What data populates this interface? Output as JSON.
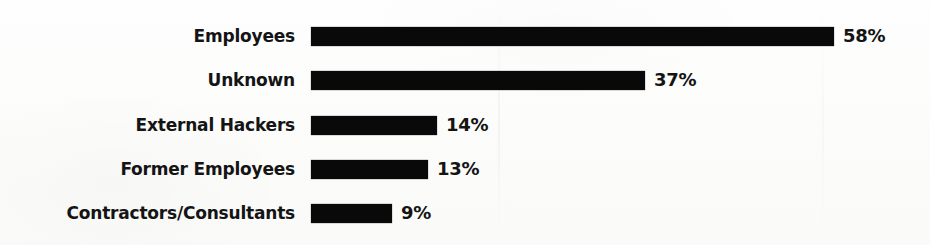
{
  "chart_data": {
    "type": "bar",
    "orientation": "horizontal",
    "title": "",
    "subtitle": "",
    "xlabel": "",
    "ylabel": "",
    "grid": false,
    "legend": false,
    "legend_position": "none",
    "value_suffix": "%",
    "xlim": [
      0,
      58
    ],
    "axis_ticks": [],
    "categories": [
      "Employees",
      "Unknown",
      "External Hackers",
      "Former Employees",
      "Contractors/Consultants"
    ],
    "values": [
      58,
      37,
      14,
      13,
      9
    ],
    "value_labels": [
      "58%",
      "37%",
      "14%",
      "13%",
      "9%"
    ],
    "bar_color": "#090909",
    "background_color": "#fdfdfc",
    "text_color": "#141414"
  },
  "layout": {
    "bar_origin_x": 311,
    "label_right_x": 295,
    "row_pitch": 44,
    "first_row_top": 24,
    "bar_height": 19,
    "px_per_unit": 9.02,
    "value_gap": 9,
    "bar_end_x": [
      834,
      678,
      481,
      458,
      424
    ]
  }
}
